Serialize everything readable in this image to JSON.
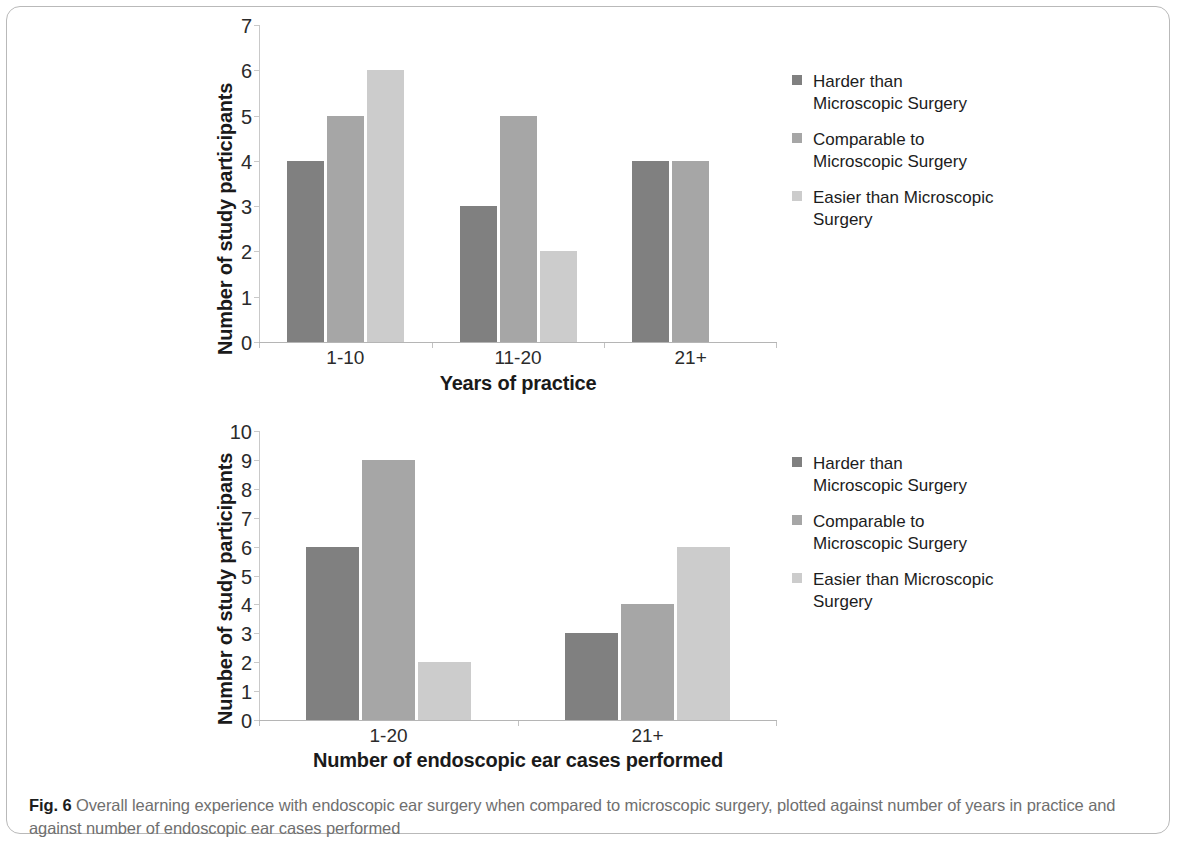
{
  "figure": {
    "caption_prefix": "Fig. 6",
    "caption_text": "Overall learning experience with endoscopic ear surgery when compared to microscopic surgery, plotted against number of years in practice and against number of endoscopic ear cases performed"
  },
  "colors": {
    "harder": "#808080",
    "comparable": "#a6a6a6",
    "easier": "#cccccc",
    "axis": "#bdbdbd",
    "text": "#222222",
    "caption": "#6f6f6f"
  },
  "chart_data": [
    {
      "id": "chart-years-of-practice",
      "type": "bar",
      "title": "",
      "xlabel": "Years of practice",
      "ylabel": "Number of study participants",
      "categories": [
        "1-10",
        "11-20",
        "21+"
      ],
      "ylim": [
        0,
        7
      ],
      "yticks": [
        0,
        1,
        2,
        3,
        4,
        5,
        6,
        7
      ],
      "grid": false,
      "legend_position": "right",
      "series": [
        {
          "name": "Harder than Microscopic Surgery",
          "values": [
            4,
            3,
            4
          ],
          "color": "#808080"
        },
        {
          "name": "Comparable to Microscopic Surgery",
          "values": [
            5,
            5,
            4
          ],
          "color": "#a6a6a6"
        },
        {
          "name": "Easier than Microscopic Surgery",
          "values": [
            6,
            2,
            0
          ],
          "color": "#cccccc"
        }
      ]
    },
    {
      "id": "chart-endoscopic-cases",
      "type": "bar",
      "title": "",
      "xlabel": "Number of endoscopic ear cases performed",
      "ylabel": "Number of study participants",
      "categories": [
        "1-20",
        "21+"
      ],
      "ylim": [
        0,
        10
      ],
      "yticks": [
        0,
        1,
        2,
        3,
        4,
        5,
        6,
        7,
        8,
        9,
        10
      ],
      "grid": false,
      "legend_position": "right",
      "series": [
        {
          "name": "Harder than Microscopic Surgery",
          "values": [
            6,
            3
          ],
          "color": "#808080"
        },
        {
          "name": "Comparable to Microscopic Surgery",
          "values": [
            9,
            4
          ],
          "color": "#a6a6a6"
        },
        {
          "name": "Easier than Microscopic Surgery",
          "values": [
            2,
            6
          ],
          "color": "#cccccc"
        }
      ]
    }
  ],
  "legend_entries": [
    {
      "line1": "Harder than",
      "line2": "Microscopic Surgery",
      "color": "#808080"
    },
    {
      "line1": "Comparable to",
      "line2": "Microscopic Surgery",
      "color": "#a6a6a6"
    },
    {
      "line1": "Easier than Microscopic",
      "line2": "Surgery",
      "color": "#cccccc"
    }
  ]
}
